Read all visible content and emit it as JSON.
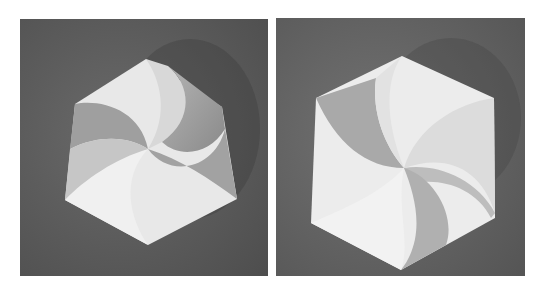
{
  "figure": {
    "panels": [
      {
        "id": "left",
        "subject": "twisted paper form, rotated, three-fold swirl"
      },
      {
        "id": "right",
        "subject": "hexagonal paper form, three-fold swirl"
      }
    ],
    "colors": {
      "background": "#5e5e5e",
      "paper_light": "#eeeeee",
      "paper_shade": "#a8a8a8",
      "page": "#ffffff"
    }
  }
}
